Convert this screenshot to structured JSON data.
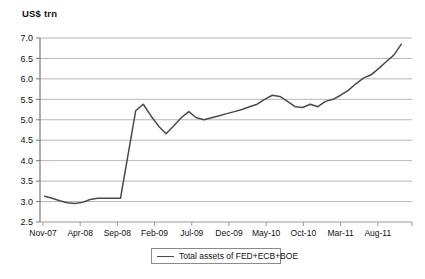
{
  "chart_data": {
    "type": "line",
    "title": "",
    "ylabel": "US$ trn",
    "xlabel": "",
    "ylim": [
      2.5,
      7.0
    ],
    "ytick_values": [
      2.5,
      3.0,
      3.5,
      4.0,
      4.5,
      5.0,
      5.5,
      6.0,
      6.5,
      7.0
    ],
    "ytick_labels": [
      "2.5",
      "3.0",
      "3.5",
      "4.0",
      "4.5",
      "5.0",
      "5.5",
      "6.0",
      "6.5",
      "7.0"
    ],
    "xtick_labels": [
      "Nov-07",
      "Apr-08",
      "Sep-08",
      "Feb-09",
      "Jul-09",
      "Dec-09",
      "May-10",
      "Oct-10",
      "Mar-11",
      "Aug-11"
    ],
    "grid": "horizontal",
    "legend_position": "bottom",
    "line_color": "#4a4a4a",
    "series": [
      {
        "name": "Total assets of FED+ECB+BOE",
        "x": [
          "Nov-07",
          "Dec-07",
          "Jan-08",
          "Feb-08",
          "Mar-08",
          "Apr-08",
          "May-08",
          "Jun-08",
          "Jul-08",
          "Aug-08",
          "Sep-08",
          "Oct-08",
          "Nov-08",
          "Dec-08",
          "Jan-09",
          "Feb-09",
          "Mar-09",
          "Apr-09",
          "May-09",
          "Jun-09",
          "Jul-09",
          "Aug-09",
          "Sep-09",
          "Oct-09",
          "Nov-09",
          "Dec-09",
          "Jan-10",
          "Feb-10",
          "Mar-10",
          "Apr-10",
          "May-10",
          "Jun-10",
          "Jul-10",
          "Aug-10",
          "Sep-10",
          "Oct-10",
          "Nov-10",
          "Dec-10",
          "Jan-11",
          "Feb-11",
          "Mar-11",
          "Apr-11",
          "May-11",
          "Jun-11",
          "Jul-11",
          "Aug-11",
          "Sep-11",
          "Oct-11"
        ],
        "values": [
          3.13,
          3.08,
          3.02,
          2.97,
          2.95,
          2.98,
          3.05,
          3.08,
          3.08,
          3.08,
          3.08,
          4.15,
          5.22,
          5.38,
          5.1,
          4.85,
          4.66,
          4.85,
          5.05,
          5.2,
          5.05,
          5.0,
          5.05,
          5.1,
          5.15,
          5.2,
          5.25,
          5.32,
          5.38,
          5.5,
          5.6,
          5.57,
          5.45,
          5.32,
          5.3,
          5.38,
          5.32,
          5.45,
          5.5,
          5.6,
          5.72,
          5.88,
          6.02,
          6.1,
          6.25,
          6.42,
          6.58,
          6.85
        ]
      }
    ]
  },
  "legend": {
    "label": "Total assets of FED+ECB+BOE"
  }
}
